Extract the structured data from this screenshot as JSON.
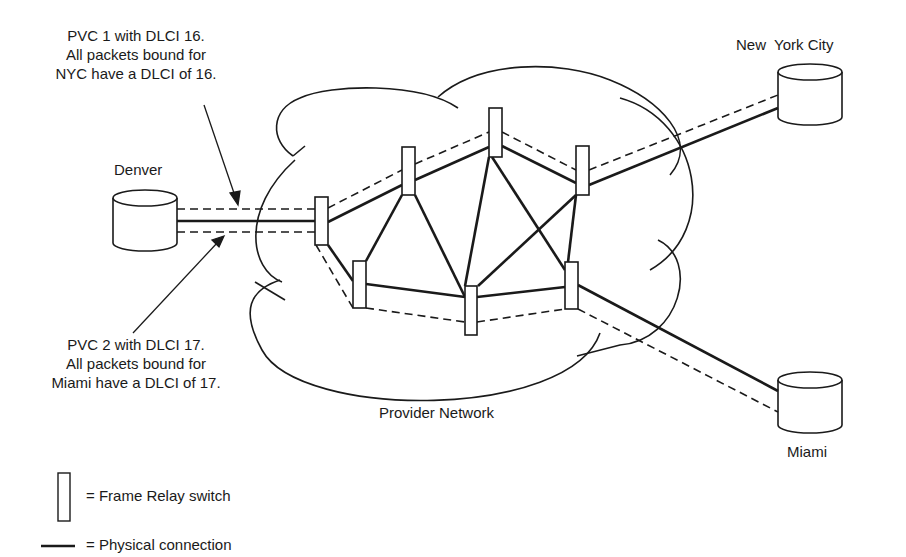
{
  "annotations": {
    "pvc1": {
      "line1": "PVC 1 with DLCI 16.",
      "line2": "All packets bound for",
      "line3": "NYC have a DLCI of 16."
    },
    "pvc2": {
      "line1": "PVC 2 with DLCI 17.",
      "line2": "All packets bound for",
      "line3": "Miami have a DLCI of 17."
    }
  },
  "sites": {
    "denver": "Denver",
    "nyc": "New  York City",
    "miami": "Miami"
  },
  "cloud_label": "Provider Network",
  "legend": {
    "switch": "= Frame Relay switch",
    "physical": "= Physical connection"
  },
  "colors": {
    "stroke": "#1a1a1a",
    "background": "#ffffff"
  }
}
